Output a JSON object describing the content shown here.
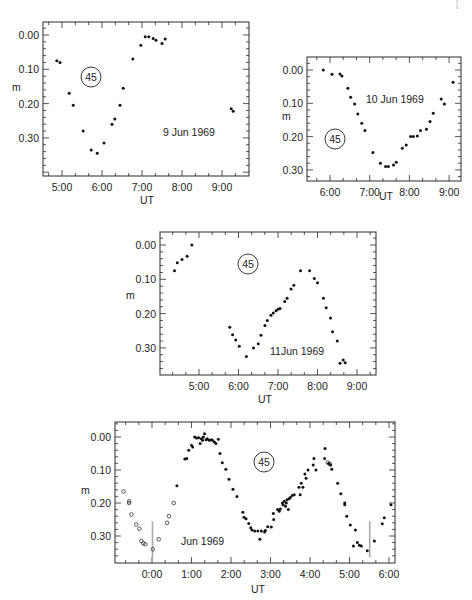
{
  "corner_mark": "[",
  "chart_data": [
    {
      "type": "scatter",
      "title": "",
      "annotation": "9 Jun 1969",
      "label_circle": "45",
      "xlabel": "UT",
      "ylabel": "m",
      "y_inverted": true,
      "xticks": [
        "5:00",
        "6:00",
        "7:00",
        "8:00",
        "9:00"
      ],
      "yticks": [
        "0.00",
        "0.10",
        "0.20",
        "0.30"
      ],
      "xlim_hours": [
        4.52,
        9.68
      ],
      "ylim": [
        -0.04,
        0.41
      ],
      "series": [
        {
          "name": "observed",
          "marker": "filled",
          "points": [
            [
              4.87,
              0.075
            ],
            [
              4.95,
              0.08
            ],
            [
              5.18,
              0.17
            ],
            [
              5.28,
              0.205
            ],
            [
              5.53,
              0.28
            ],
            [
              5.73,
              0.335
            ],
            [
              5.88,
              0.345
            ],
            [
              6.05,
              0.315
            ],
            [
              6.25,
              0.26
            ],
            [
              6.32,
              0.245
            ],
            [
              6.45,
              0.205
            ],
            [
              6.53,
              0.155
            ],
            [
              6.77,
              0.07
            ],
            [
              6.97,
              0.03
            ],
            [
              7.08,
              0.005
            ],
            [
              7.17,
              0.005
            ],
            [
              7.28,
              0.01
            ],
            [
              7.35,
              0.015
            ],
            [
              7.5,
              0.025
            ],
            [
              7.58,
              0.012
            ],
            [
              9.23,
              0.215
            ],
            [
              9.28,
              0.222
            ]
          ]
        }
      ],
      "frame": {
        "x0": 43,
        "y0": 22,
        "x1": 249,
        "y1": 176
      },
      "map": {
        "x_at_ref": 62,
        "x_ref_h": 5,
        "px_per_h": 40,
        "y_at_0": 35,
        "px_per_unit": 343
      },
      "annotation_pos": [
        163,
        136
      ],
      "circle_pos": [
        91,
        77
      ],
      "xlabel_pos": [
        147,
        204
      ],
      "ylabel_pos": [
        12,
        91
      ]
    },
    {
      "type": "scatter",
      "annotation": "10 Jun 1969",
      "label_circle": "45",
      "xlabel": "UT",
      "ylabel": "m",
      "y_inverted": true,
      "xticks": [
        "6:00",
        "7:00",
        "8:00",
        "9:00"
      ],
      "yticks": [
        "0.00",
        "0.10",
        "0.20",
        "0.30"
      ],
      "xlim_hours": [
        5.58,
        9.45
      ],
      "ylim": [
        -0.04,
        0.33
      ],
      "series": [
        {
          "name": "observed",
          "marker": "filled",
          "points": [
            [
              5.83,
              0.0
            ],
            [
              6.05,
              0.013
            ],
            [
              6.25,
              0.012
            ],
            [
              6.3,
              0.018
            ],
            [
              6.45,
              0.055
            ],
            [
              6.52,
              0.082
            ],
            [
              6.62,
              0.102
            ],
            [
              6.7,
              0.132
            ],
            [
              6.8,
              0.16
            ],
            [
              6.88,
              0.182
            ],
            [
              7.08,
              0.248
            ],
            [
              7.27,
              0.28
            ],
            [
              7.4,
              0.29
            ],
            [
              7.47,
              0.29
            ],
            [
              7.6,
              0.285
            ],
            [
              7.67,
              0.277
            ],
            [
              7.82,
              0.235
            ],
            [
              7.92,
              0.225
            ],
            [
              8.03,
              0.2
            ],
            [
              8.1,
              0.2
            ],
            [
              8.2,
              0.198
            ],
            [
              8.28,
              0.182
            ],
            [
              8.43,
              0.178
            ],
            [
              8.52,
              0.155
            ],
            [
              8.6,
              0.13
            ],
            [
              8.8,
              0.087
            ],
            [
              8.88,
              0.102
            ],
            [
              9.1,
              0.037
            ]
          ]
        }
      ],
      "frame": {
        "x0": 307,
        "y0": 57,
        "x1": 461,
        "y1": 181
      },
      "map": {
        "x_at_ref": 330,
        "x_ref_h": 6,
        "px_per_h": 39.7,
        "y_at_0": 70,
        "px_per_unit": 333
      },
      "annotation_pos": [
        366,
        103
      ],
      "circle_pos": [
        335,
        139
      ],
      "xlabel_pos": [
        386,
        200
      ],
      "ylabel_pos": [
        282,
        120
      ]
    },
    {
      "type": "scatter",
      "annotation": "11Jun 1969",
      "label_circle": "45",
      "xlabel": "UT",
      "ylabel": "m",
      "y_inverted": true,
      "xticks": [
        "5:00",
        "6:00",
        "7:00",
        "8:00",
        "9:00"
      ],
      "yticks": [
        "0.00",
        "0.10",
        "0.20",
        "0.30"
      ],
      "xlim_hours": [
        4.02,
        9.5
      ],
      "ylim": [
        -0.04,
        0.37
      ],
      "series": [
        {
          "name": "observed",
          "marker": "filled",
          "points": [
            [
              4.38,
              0.075
            ],
            [
              4.45,
              0.052
            ],
            [
              4.57,
              0.042
            ],
            [
              4.7,
              0.033
            ],
            [
              4.82,
              0.0
            ],
            [
              5.78,
              0.24
            ],
            [
              5.85,
              0.262
            ],
            [
              5.93,
              0.277
            ],
            [
              6.02,
              0.295
            ],
            [
              6.2,
              0.325
            ],
            [
              6.38,
              0.3
            ],
            [
              6.5,
              0.288
            ],
            [
              6.57,
              0.263
            ],
            [
              6.67,
              0.235
            ],
            [
              6.73,
              0.22
            ],
            [
              6.82,
              0.205
            ],
            [
              6.88,
              0.198
            ],
            [
              6.95,
              0.192
            ],
            [
              7.0,
              0.187
            ],
            [
              7.05,
              0.185
            ],
            [
              7.17,
              0.165
            ],
            [
              7.23,
              0.155
            ],
            [
              7.33,
              0.128
            ],
            [
              7.4,
              0.117
            ],
            [
              7.57,
              0.075
            ],
            [
              7.8,
              0.075
            ],
            [
              7.92,
              0.098
            ],
            [
              8.0,
              0.11
            ],
            [
              8.15,
              0.155
            ],
            [
              8.22,
              0.183
            ],
            [
              8.33,
              0.213
            ],
            [
              8.38,
              0.253
            ],
            [
              8.5,
              0.28
            ],
            [
              8.57,
              0.345
            ],
            [
              8.65,
              0.335
            ],
            [
              8.7,
              0.343
            ]
          ]
        }
      ],
      "frame": {
        "x0": 160,
        "y0": 232,
        "x1": 376,
        "y1": 375
      },
      "map": {
        "x_at_ref": 199,
        "x_ref_h": 5,
        "px_per_h": 39.5,
        "y_at_0": 245,
        "px_per_unit": 343
      },
      "annotation_pos": [
        270,
        355
      ],
      "circle_pos": [
        248,
        264
      ],
      "xlabel_pos": [
        265,
        403
      ],
      "ylabel_pos": [
        126,
        299
      ]
    },
    {
      "type": "scatter",
      "annotation": "Jun 1969",
      "label_circle": "45",
      "xlabel": "UT",
      "ylabel": "m",
      "y_inverted": true,
      "xticks": [
        "0:00",
        "1:00",
        "2:00",
        "3:00",
        "4:00",
        "5:00",
        "6:00"
      ],
      "yticks": [
        "0.00",
        "0.10",
        "0.20",
        "0.30"
      ],
      "xlim_hours": [
        -0.94,
        6.15
      ],
      "ylim": [
        -0.05,
        0.38
      ],
      "vertical_markers_hours": [
        0.0,
        5.5
      ],
      "series": [
        {
          "name": "open",
          "marker": "open",
          "points": [
            [
              -0.72,
              0.165
            ],
            [
              -0.58,
              0.195
            ],
            [
              -0.58,
              0.2
            ],
            [
              -0.52,
              0.235
            ],
            [
              -0.4,
              0.265
            ],
            [
              -0.32,
              0.278
            ],
            [
              -0.27,
              0.315
            ],
            [
              -0.22,
              0.322
            ],
            [
              -0.17,
              0.325
            ],
            [
              0.02,
              0.34
            ],
            [
              0.17,
              0.31
            ],
            [
              0.38,
              0.26
            ],
            [
              0.43,
              0.24
            ],
            [
              0.55,
              0.2
            ],
            [
              4.45,
              0.077
            ],
            [
              4.5,
              0.082
            ]
          ]
        },
        {
          "name": "filled",
          "marker": "filled",
          "points": [
            [
              0.63,
              0.148
            ],
            [
              0.83,
              0.067
            ],
            [
              0.88,
              0.065
            ],
            [
              0.93,
              0.04
            ],
            [
              1.0,
              0.025
            ],
            [
              1.03,
              0.03
            ],
            [
              1.08,
              0.0
            ],
            [
              1.13,
              0.003
            ],
            [
              1.18,
              0.002
            ],
            [
              1.22,
              0.02
            ],
            [
              1.25,
              0.005
            ],
            [
              1.28,
              0.01
            ],
            [
              1.3,
              0.0
            ],
            [
              1.33,
              -0.01
            ],
            [
              1.37,
              0.008
            ],
            [
              1.4,
              0.005
            ],
            [
              1.45,
              0.01
            ],
            [
              1.5,
              0.008
            ],
            [
              1.53,
              0.01
            ],
            [
              1.58,
              0.015
            ],
            [
              1.62,
              0.02
            ],
            [
              1.68,
              0.007
            ],
            [
              1.72,
              0.05
            ],
            [
              1.78,
              0.078
            ],
            [
              1.87,
              0.098
            ],
            [
              1.95,
              0.128
            ],
            [
              2.05,
              0.158
            ],
            [
              2.15,
              0.18
            ],
            [
              2.3,
              0.228
            ],
            [
              2.33,
              0.243
            ],
            [
              2.38,
              0.248
            ],
            [
              2.45,
              0.262
            ],
            [
              2.5,
              0.275
            ],
            [
              2.53,
              0.282
            ],
            [
              2.6,
              0.285
            ],
            [
              2.68,
              0.285
            ],
            [
              2.73,
              0.31
            ],
            [
              2.77,
              0.285
            ],
            [
              2.85,
              0.288
            ],
            [
              2.87,
              0.283
            ],
            [
              2.93,
              0.272
            ],
            [
              3.02,
              0.273
            ],
            [
              3.08,
              0.25
            ],
            [
              3.07,
              0.232
            ],
            [
              3.18,
              0.22
            ],
            [
              3.22,
              0.225
            ],
            [
              3.25,
              0.218
            ],
            [
              3.3,
              0.2
            ],
            [
              3.32,
              0.205
            ],
            [
              3.35,
              0.195
            ],
            [
              3.38,
              0.21
            ],
            [
              3.4,
              0.2
            ],
            [
              3.42,
              0.19
            ],
            [
              3.45,
              0.22
            ],
            [
              3.47,
              0.187
            ],
            [
              3.5,
              0.183
            ],
            [
              3.55,
              0.177
            ],
            [
              3.6,
              0.175
            ],
            [
              3.72,
              0.152
            ],
            [
              3.75,
              0.175
            ],
            [
              3.78,
              0.14
            ],
            [
              3.82,
              0.152
            ],
            [
              3.87,
              0.112
            ],
            [
              3.9,
              0.125
            ],
            [
              3.95,
              0.1
            ],
            [
              4.08,
              0.085
            ],
            [
              4.1,
              0.065
            ],
            [
              4.15,
              0.1
            ],
            [
              4.37,
              0.065
            ],
            [
              4.38,
              0.035
            ],
            [
              4.47,
              0.08
            ],
            [
              4.52,
              0.085
            ],
            [
              4.55,
              0.098
            ],
            [
              4.7,
              0.14
            ],
            [
              4.78,
              0.172
            ],
            [
              4.88,
              0.2
            ],
            [
              4.88,
              0.205
            ],
            [
              4.93,
              0.24
            ],
            [
              5.02,
              0.267
            ],
            [
              5.1,
              0.33
            ],
            [
              5.15,
              0.282
            ],
            [
              5.2,
              0.32
            ],
            [
              5.25,
              0.328
            ],
            [
              5.3,
              0.33
            ],
            [
              5.45,
              0.345
            ],
            [
              5.63,
              0.315
            ],
            [
              5.83,
              0.263
            ],
            [
              5.88,
              0.245
            ],
            [
              6.05,
              0.205
            ]
          ]
        }
      ],
      "frame": {
        "x0": 115,
        "y0": 422,
        "x1": 395,
        "y1": 563
      },
      "map": {
        "x_at_ref": 152,
        "x_ref_h": 0,
        "px_per_h": 39.5,
        "y_at_0": 437,
        "px_per_unit": 330
      },
      "annotation_pos": [
        181,
        545
      ],
      "circle_pos": [
        264,
        462
      ],
      "xlabel_pos": [
        258,
        593
      ],
      "ylabel_pos": [
        81,
        494
      ]
    }
  ]
}
